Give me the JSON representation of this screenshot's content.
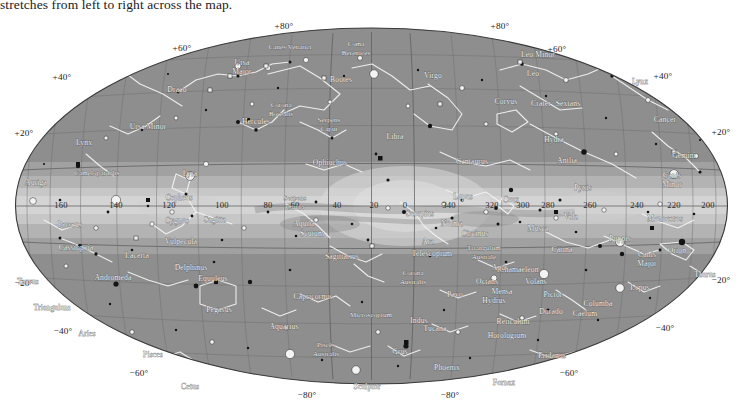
{
  "caption": {
    "text": "stretches from left to right across the map."
  },
  "map": {
    "title": "All-sky star map in galactic coordinates",
    "projection": "aitoff",
    "background_color": "#8e8e8e",
    "milkyway_color": "#c9c9c9",
    "grid_color": "#6e6e6e",
    "constellation_line_color": "#f2f2f2",
    "star_color": "#141414"
  },
  "chart_data": {
    "type": "scatter",
    "xlabel": "Galactic longitude",
    "ylabel": "Galactic latitude",
    "xlim": [
      180,
      -180
    ],
    "ylim": [
      -90,
      90
    ],
    "grid": true,
    "legend": "none",
    "longitude_ticks": [
      {
        "label": "160",
        "value": 160,
        "x": 61,
        "y": 205
      },
      {
        "label": "140",
        "value": 140,
        "x": 116,
        "y": 205
      },
      {
        "label": "120",
        "value": 120,
        "x": 169,
        "y": 205
      },
      {
        "label": "100",
        "value": 100,
        "x": 222,
        "y": 205
      },
      {
        "label": "80",
        "value": 80,
        "x": 268,
        "y": 205
      },
      {
        "label": "60",
        "value": 60,
        "x": 295,
        "y": 205
      },
      {
        "label": "40",
        "value": 40,
        "x": 337,
        "y": 205
      },
      {
        "label": "20",
        "value": 20,
        "x": 374,
        "y": 205
      },
      {
        "label": "0",
        "value": 0,
        "x": 405,
        "y": 205
      },
      {
        "label": "340",
        "value": 340,
        "x": 449,
        "y": 205
      },
      {
        "label": "320",
        "value": 320,
        "x": 492,
        "y": 205
      },
      {
        "label": "300",
        "value": 300,
        "x": 523,
        "y": 205
      },
      {
        "label": "280",
        "value": 280,
        "x": 548,
        "y": 205
      },
      {
        "label": "260",
        "value": 260,
        "x": 590,
        "y": 205
      },
      {
        "label": "240",
        "value": 240,
        "x": 637,
        "y": 205
      },
      {
        "label": "220",
        "value": 220,
        "x": 674,
        "y": 205
      },
      {
        "label": "200",
        "value": 200,
        "x": 708,
        "y": 205
      }
    ],
    "latitude_labels": [
      {
        "label": "+80°",
        "value": 80,
        "x": 284,
        "y": 26
      },
      {
        "label": "+80°",
        "value": 80,
        "x": 500,
        "y": 26
      },
      {
        "label": "+60°",
        "value": 60,
        "x": 182,
        "y": 47
      },
      {
        "label": "+60°",
        "value": 60,
        "x": 555,
        "y": 48
      },
      {
        "label": "+40°",
        "value": 40,
        "x": 62,
        "y": 76
      },
      {
        "label": "+40°",
        "value": 40,
        "x": 661,
        "y": 75
      },
      {
        "label": "+20°",
        "value": 20,
        "x": 22,
        "y": 132
      },
      {
        "label": "+20°",
        "value": 20,
        "x": 725,
        "y": 131
      },
      {
        "label": "−20°",
        "value": -20,
        "x": 22,
        "y": 282
      },
      {
        "label": "−20°",
        "value": -20,
        "x": 725,
        "y": 279
      },
      {
        "label": "−40°",
        "value": -40,
        "x": 63,
        "y": 330
      },
      {
        "label": "−40°",
        "value": -40,
        "x": 663,
        "y": 327
      },
      {
        "label": "−60°",
        "value": -60,
        "x": 139,
        "y": 372
      },
      {
        "label": "−60°",
        "value": -60,
        "x": 567,
        "y": 372
      },
      {
        "label": "−80°",
        "value": -80,
        "x": 307,
        "y": 392
      },
      {
        "label": "−80°",
        "value": -80,
        "x": 450,
        "y": 392
      }
    ],
    "constellations": [
      {
        "name": "Ursa Major",
        "x": 242,
        "y": 51,
        "lines": 2
      },
      {
        "name": "Canes Venatici",
        "x": 290,
        "y": 35,
        "lines": 1
      },
      {
        "name": "Coma Berenices",
        "x": 356,
        "y": 32,
        "lines": 2
      },
      {
        "name": "Bootes",
        "x": 341,
        "y": 68,
        "lines": 1
      },
      {
        "name": "Corona Borealis",
        "x": 281,
        "y": 93,
        "lines": 2
      },
      {
        "name": "Draco",
        "x": 177,
        "y": 78,
        "lines": 1
      },
      {
        "name": "Ursa Minor",
        "x": 148,
        "y": 115,
        "lines": 1
      },
      {
        "name": "Lynx",
        "x": 84,
        "y": 131,
        "lines": 1
      },
      {
        "name": "Camelopardalis",
        "x": 97,
        "y": 161,
        "lines": 1
      },
      {
        "name": "Auriga",
        "x": 36,
        "y": 171,
        "lines": 1
      },
      {
        "name": "Cepheus",
        "x": 179,
        "y": 186,
        "lines": 1
      },
      {
        "name": "Perseus",
        "x": 70,
        "y": 213,
        "lines": 1
      },
      {
        "name": "Cassiopeia",
        "x": 76,
        "y": 236,
        "lines": 1
      },
      {
        "name": "Lacerta",
        "x": 137,
        "y": 244,
        "lines": 1
      },
      {
        "name": "Andromeda",
        "x": 113,
        "y": 266,
        "lines": 1
      },
      {
        "name": "Taurus",
        "x": 28,
        "y": 270,
        "lines": 1
      },
      {
        "name": "Triangulum",
        "x": 52,
        "y": 296,
        "lines": 1
      },
      {
        "name": "Aries",
        "x": 87,
        "y": 322,
        "lines": 1
      },
      {
        "name": "Pisces",
        "x": 153,
        "y": 343,
        "lines": 1
      },
      {
        "name": "Cetus",
        "x": 190,
        "y": 375,
        "lines": 1
      },
      {
        "name": "Lyra",
        "x": 190,
        "y": 162,
        "lines": 1
      },
      {
        "name": "Cygnus",
        "x": 177,
        "y": 209,
        "lines": 1
      },
      {
        "name": "Vulpecula",
        "x": 181,
        "y": 230,
        "lines": 1
      },
      {
        "name": "Sagitta",
        "x": 215,
        "y": 208,
        "lines": 1
      },
      {
        "name": "Delphinus",
        "x": 191,
        "y": 256,
        "lines": 1
      },
      {
        "name": "Equuleus",
        "x": 213,
        "y": 267,
        "lines": 1
      },
      {
        "name": "Pegasus",
        "x": 219,
        "y": 298,
        "lines": 1
      },
      {
        "name": "Aquarius",
        "x": 284,
        "y": 315,
        "lines": 1
      },
      {
        "name": "Capricornus",
        "x": 313,
        "y": 285,
        "lines": 1
      },
      {
        "name": "Pisces Australis",
        "x": 326,
        "y": 333,
        "lines": 2
      },
      {
        "name": "Sculptor",
        "x": 367,
        "y": 375,
        "lines": 1
      },
      {
        "name": "Hercules",
        "x": 256,
        "y": 110,
        "lines": 1
      },
      {
        "name": "Serpens Caput",
        "x": 329,
        "y": 108,
        "lines": 2
      },
      {
        "name": "Ophiuchus",
        "x": 330,
        "y": 151,
        "lines": 1
      },
      {
        "name": "Serpens Cauda",
        "x": 295,
        "y": 186,
        "lines": 2
      },
      {
        "name": "Aquila",
        "x": 304,
        "y": 212,
        "lines": 1
      },
      {
        "name": "Scutum",
        "x": 312,
        "y": 222,
        "lines": 1
      },
      {
        "name": "Sagittarius",
        "x": 342,
        "y": 245,
        "lines": 1
      },
      {
        "name": "Corona Australis",
        "x": 413,
        "y": 261,
        "lines": 2
      },
      {
        "name": "Libra",
        "x": 395,
        "y": 125,
        "lines": 1
      },
      {
        "name": "Virgo",
        "x": 433,
        "y": 64,
        "lines": 1
      },
      {
        "name": "Leo",
        "x": 533,
        "y": 62,
        "lines": 1
      },
      {
        "name": "Leo Minor",
        "x": 538,
        "y": 43,
        "lines": 1
      },
      {
        "name": "Lynx",
        "x": 640,
        "y": 70,
        "lines": 1
      },
      {
        "name": "Cancer",
        "x": 665,
        "y": 108,
        "lines": 1
      },
      {
        "name": "Gemini",
        "x": 684,
        "y": 144,
        "lines": 1
      },
      {
        "name": "Canis Minor",
        "x": 672,
        "y": 164,
        "lines": 2
      },
      {
        "name": "Sextans",
        "x": 568,
        "y": 92,
        "lines": 1
      },
      {
        "name": "Crater",
        "x": 541,
        "y": 92,
        "lines": 1
      },
      {
        "name": "Corvus",
        "x": 506,
        "y": 90,
        "lines": 1
      },
      {
        "name": "Hydra",
        "x": 554,
        "y": 128,
        "lines": 1
      },
      {
        "name": "Antlia",
        "x": 567,
        "y": 149,
        "lines": 1
      },
      {
        "name": "Pyxis",
        "x": 583,
        "y": 176,
        "lines": 1
      },
      {
        "name": "Centaurus",
        "x": 472,
        "y": 150,
        "lines": 1
      },
      {
        "name": "Lupus",
        "x": 463,
        "y": 185,
        "lines": 1
      },
      {
        "name": "Norma",
        "x": 452,
        "y": 212,
        "lines": 1
      },
      {
        "name": "Circinus",
        "x": 475,
        "y": 222,
        "lines": 1
      },
      {
        "name": "Ara",
        "x": 428,
        "y": 230,
        "lines": 1
      },
      {
        "name": "Telescopium",
        "x": 432,
        "y": 242,
        "lines": 1
      },
      {
        "name": "Triangulum Australe",
        "x": 484,
        "y": 236,
        "lines": 2
      },
      {
        "name": "Apus",
        "x": 500,
        "y": 256,
        "lines": 1
      },
      {
        "name": "Pavo",
        "x": 455,
        "y": 283,
        "lines": 1
      },
      {
        "name": "Indus",
        "x": 419,
        "y": 309,
        "lines": 1
      },
      {
        "name": "Microscopium",
        "x": 371,
        "y": 303,
        "lines": 1
      },
      {
        "name": "Grus",
        "x": 400,
        "y": 340,
        "lines": 1
      },
      {
        "name": "Tucana",
        "x": 435,
        "y": 317,
        "lines": 1
      },
      {
        "name": "Phoenix",
        "x": 447,
        "y": 356,
        "lines": 1
      },
      {
        "name": "Octans",
        "x": 487,
        "y": 270,
        "lines": 1
      },
      {
        "name": "Hydrus",
        "x": 494,
        "y": 289,
        "lines": 1
      },
      {
        "name": "Mensa",
        "x": 502,
        "y": 280,
        "lines": 1
      },
      {
        "name": "Reticulum",
        "x": 513,
        "y": 310,
        "lines": 1
      },
      {
        "name": "Horologium",
        "x": 507,
        "y": 324,
        "lines": 1
      },
      {
        "name": "Eridanus",
        "x": 552,
        "y": 344,
        "lines": 1
      },
      {
        "name": "Fornax",
        "x": 504,
        "y": 371,
        "lines": 1
      },
      {
        "name": "Caelum",
        "x": 585,
        "y": 302,
        "lines": 1
      },
      {
        "name": "Dorado",
        "x": 551,
        "y": 300,
        "lines": 1
      },
      {
        "name": "Pictor",
        "x": 553,
        "y": 283,
        "lines": 1
      },
      {
        "name": "Columba",
        "x": 598,
        "y": 292,
        "lines": 1
      },
      {
        "name": "Volans",
        "x": 536,
        "y": 270,
        "lines": 1
      },
      {
        "name": "Chamaeleon",
        "x": 519,
        "y": 258,
        "lines": 1
      },
      {
        "name": "Carina",
        "x": 562,
        "y": 238,
        "lines": 1
      },
      {
        "name": "Musca",
        "x": 538,
        "y": 217,
        "lines": 1
      },
      {
        "name": "Crux",
        "x": 511,
        "y": 188,
        "lines": 1
      },
      {
        "name": "Vela",
        "x": 571,
        "y": 205,
        "lines": 1
      },
      {
        "name": "Puppis",
        "x": 620,
        "y": 227,
        "lines": 1
      },
      {
        "name": "Canis Major",
        "x": 647,
        "y": 243,
        "lines": 2
      },
      {
        "name": "Lepus",
        "x": 640,
        "y": 276,
        "lines": 1
      },
      {
        "name": "Orion",
        "x": 677,
        "y": 239,
        "lines": 1
      },
      {
        "name": "Monoceros",
        "x": 665,
        "y": 207,
        "lines": 1
      },
      {
        "name": "Taurus",
        "x": 705,
        "y": 263,
        "lines": 1
      },
      {
        "name": "Scorpius",
        "x": 420,
        "y": 202,
        "lines": 1
      }
    ]
  }
}
